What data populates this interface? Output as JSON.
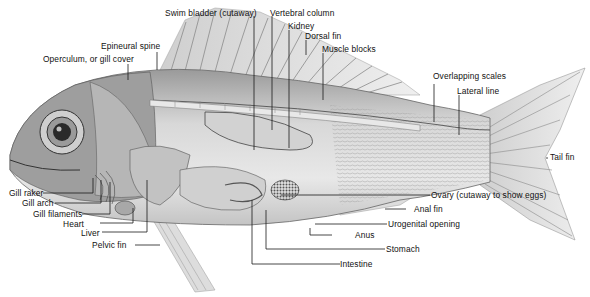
{
  "labels": {
    "swim_bladder": "Swim bladder (cutaway)",
    "vertebral_column": "Vertebral column",
    "kidney": "Kidney",
    "dorsal_fin": "Dorsal fin",
    "muscle_blocks": "Muscle blocks",
    "epineural_spine": "Epineural spine",
    "operculum": "Operculum, or gill cover",
    "overlapping_scales": "Overlapping scales",
    "lateral_line": "Lateral line",
    "tail_fin": "Tail fin",
    "gill_raker": "Gill raker",
    "gill_arch": "Gill arch",
    "gill_filaments": "Gill filaments",
    "heart": "Heart",
    "liver": "Liver",
    "pelvic_fin": "Pelvic fin",
    "ovary": "Ovary (cutaway to show eggs)",
    "anal_fin": "Anal fin",
    "urogenital_opening": "Urogenital opening",
    "anus": "Anus",
    "stomach": "Stomach",
    "intestine": "Intestine"
  },
  "colors": {
    "body_light": "#e6e6e6",
    "body_mid": "#bdbdbd",
    "body_dark": "#6a6a6a",
    "line": "#1a1a1a"
  }
}
